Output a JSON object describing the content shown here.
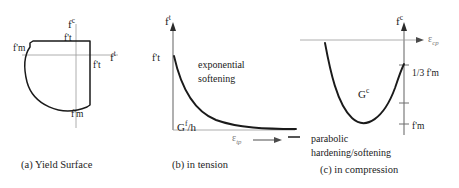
{
  "figure": {
    "title": "",
    "panels": [
      {
        "id": "a",
        "caption": "(a) Yield Surface",
        "axis_v_label": "f",
        "axis_v_sup": "c",
        "axis_h_label": "f",
        "axis_h_sup": "t",
        "labels": {
          "left": "f'm",
          "bottom": "f'm",
          "top_inner": "f't",
          "right_inner": "f't"
        }
      },
      {
        "id": "b",
        "caption": "(b) in tension",
        "axis_v_label": "f",
        "axis_v_sup": "t",
        "peak_label": "f't",
        "annotation": "exponential softening",
        "annotation_line1": "exponential",
        "annotation_line2": "softening",
        "energy_label": "G",
        "energy_sup": "f",
        "energy_rest": "/h",
        "strain_label": "ε",
        "strain_sub": "tp"
      },
      {
        "id": "c",
        "caption": "(c) in compression",
        "axis_v_label": "f",
        "axis_v_sup": "c",
        "strain_label": "ε",
        "strain_sub": "cp",
        "energy_label": "G",
        "energy_sup": "c",
        "tick_upper": "1/3 f'm",
        "tick_lower": "f'm",
        "annotation_line1": "parabolic",
        "annotation_line2": "hardening/softening"
      }
    ]
  },
  "colors": {
    "curve": "#1a1a1a",
    "axis": "#2b2b2b",
    "thin_axis": "#8a8a8a",
    "strain_text": "#8a8a8a",
    "background": "#ffffff"
  }
}
